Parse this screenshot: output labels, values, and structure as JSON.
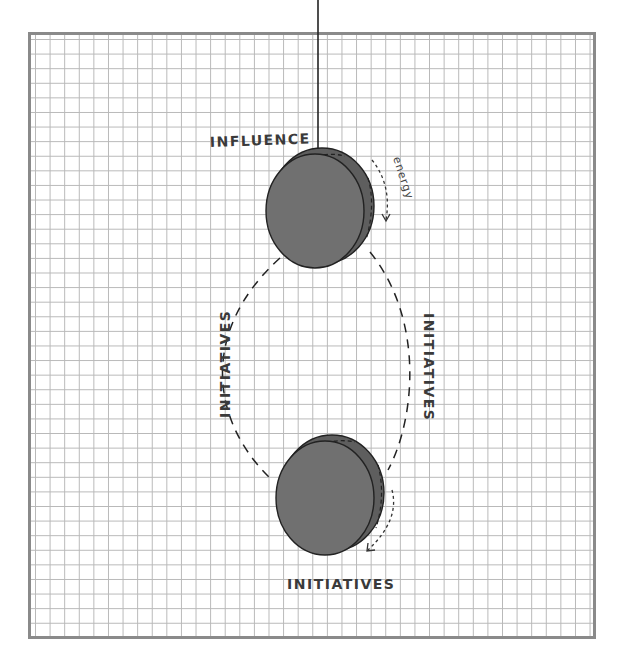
{
  "diagram": {
    "labels": {
      "top_disc": "INFLUENCE",
      "energy": "energy",
      "left_arc": "INITIATIVES",
      "right_arc": "INITIATIVES",
      "bottom_disc": "INITIATIVES"
    },
    "colors": {
      "disc_fill": "#6e6e6e",
      "disc_rim": "#5a5a5a",
      "stroke": "#222222",
      "grid": "#b8b8b8",
      "frame": "#8a8a8a",
      "text": "#3a3a3a"
    }
  }
}
